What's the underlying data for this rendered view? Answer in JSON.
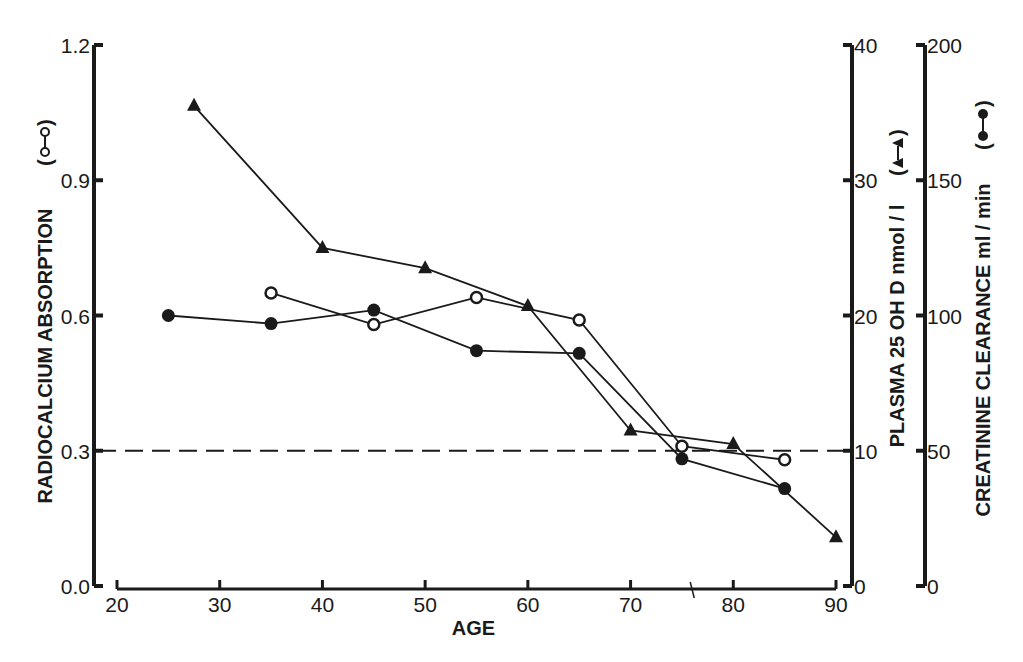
{
  "chart_data": {
    "type": "line",
    "title": "",
    "xlabel": "AGE",
    "x_ticks": [
      20,
      30,
      40,
      50,
      60,
      70,
      80,
      90
    ],
    "xlim": [
      20,
      90
    ],
    "axes": {
      "left": {
        "label": "RADIOCALCIUM  ABSORPTION (o—o)",
        "ylim": [
          0.0,
          1.2
        ],
        "ticks": [
          "0.0",
          "0.3",
          "0.6",
          "0.9",
          "1.2"
        ]
      },
      "right1": {
        "label": "PLASMA  25 OH D   nmol / l  (▲—▲)",
        "ylim": [
          0,
          40
        ],
        "ticks": [
          "0",
          "10",
          "20",
          "30",
          "40"
        ]
      },
      "right2": {
        "label": "CREATININE  CLEARANCE  ml / min  (●—●)",
        "ylim": [
          0,
          200
        ],
        "ticks": [
          "0",
          "50",
          "100",
          "150",
          "200"
        ]
      }
    },
    "reference_line": {
      "style": "dashed",
      "left_value": 0.3,
      "right1_value": 10,
      "right2_value": 50
    },
    "series": [
      {
        "name": "Radiocalcium absorption",
        "marker": "open-circle",
        "axis": "left",
        "x": [
          35,
          45,
          55,
          65,
          75,
          85
        ],
        "values": [
          0.65,
          0.58,
          0.64,
          0.59,
          0.31,
          0.28
        ]
      },
      {
        "name": "Plasma 25 OH D (nmol/l)",
        "marker": "filled-triangle",
        "axis": "right1",
        "x": [
          27.5,
          40,
          50,
          60,
          70,
          80,
          90
        ],
        "values": [
          35.5,
          25,
          23.5,
          20.7,
          11.5,
          10.5,
          3.6
        ]
      },
      {
        "name": "Creatinine clearance (ml/min)",
        "marker": "filled-circle",
        "axis": "right2",
        "x": [
          25,
          35,
          45,
          55,
          65,
          75,
          85
        ],
        "values": [
          100,
          97,
          102,
          87,
          86,
          47,
          36
        ]
      }
    ],
    "grid": false,
    "legend_position": "inline-in-axis-labels"
  },
  "labels": {
    "xlabel": "AGE",
    "left_title": "RADIOCALCIUM  ABSORPTION",
    "right1_title": "PLASMA  25 OH D   nmol / l",
    "right2_title": "CREATININE  CLEARANCE  ml / min"
  }
}
